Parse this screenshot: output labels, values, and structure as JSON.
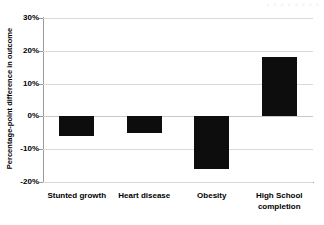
{
  "watermark": {
    "text": "▪ ▪ ▪ ▪ ▪ ▪ ▪ ▪"
  },
  "chart_data": {
    "type": "bar",
    "title": "",
    "xlabel": "",
    "ylabel": "Percentage-point difference in outcome",
    "categories": [
      "Stunted growth",
      "Heart disease",
      "Obesity",
      "High School\ncompletion"
    ],
    "values": [
      -6,
      -5,
      -16,
      18
    ],
    "ylim": [
      -20,
      30
    ],
    "ytick_values": [
      30,
      20,
      10,
      0,
      -10,
      -20
    ],
    "ytick_labels": [
      "30%",
      "20%",
      "10%",
      "0%",
      "-10%",
      "-20%"
    ],
    "grid": true,
    "legend": false,
    "bar_color": "#0d0d0d",
    "gridline_color": "#d9d9d9",
    "axis_color": "#9a9a9a",
    "background": "#ffffff"
  }
}
